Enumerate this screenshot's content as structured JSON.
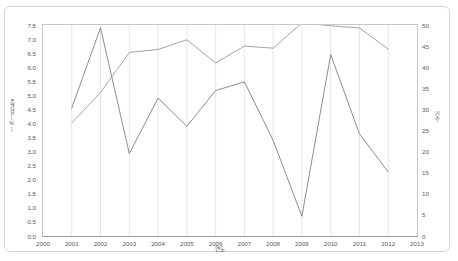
{
  "chart": {
    "type": "line",
    "title": "",
    "background_color": "#ffffff",
    "frame_color": "#d3d3d3",
    "grid": {
      "vertical": true,
      "horizontal": false,
      "color": "#e6e6e6"
    },
    "legend": {
      "visible": false,
      "position": "none"
    }
  },
  "axes": {
    "x": {
      "label": "연도",
      "ticks": [
        "2000",
        "2001",
        "2002",
        "2003",
        "2004",
        "2005",
        "2006",
        "2007",
        "2008",
        "2009",
        "2010",
        "2011",
        "2012",
        "2013"
      ],
      "min": 2000,
      "max": 2013
    },
    "y_left": {
      "label": "증가율(%)",
      "ticks": [
        "0.0",
        "0.5",
        "1.0",
        "1.5",
        "2.0",
        "2.5",
        "3.0",
        "3.5",
        "4.0",
        "4.5",
        "5.0",
        "5.5",
        "6.0",
        "6.5",
        "7.0",
        "7.5"
      ],
      "min": 0.0,
      "max": 7.5,
      "step": 0.5
    },
    "y_right": {
      "label": "건수",
      "ticks": [
        "0",
        "5",
        "10",
        "15",
        "20",
        "25",
        "30",
        "35",
        "40",
        "45",
        "50"
      ],
      "min": 0,
      "max": 50,
      "step": 5
    }
  },
  "chart_data": {
    "type": "line",
    "title": "",
    "xlabel": "연도",
    "ylabel": "증가율(%)",
    "ylabel_right": "건수",
    "x": [
      2001,
      2002,
      2003,
      2004,
      2005,
      2006,
      2007,
      2008,
      2009,
      2010,
      2011,
      2012
    ],
    "xlim": [
      2000,
      2013
    ],
    "ylim": [
      0.0,
      7.5
    ],
    "ylim_right": [
      0,
      50
    ],
    "grid": "vertical-only",
    "legend_position": "none",
    "series": [
      {
        "name": "series-1",
        "axis": "left",
        "color": "#808080",
        "values": [
          4.55,
          7.4,
          2.93,
          4.9,
          3.9,
          5.17,
          5.48,
          3.4,
          0.7,
          6.45,
          3.63,
          2.28
        ]
      },
      {
        "name": "series-2",
        "axis": "right",
        "color": "#9a9a9a",
        "values": [
          26.8,
          34.0,
          43.5,
          44.2,
          46.5,
          41.0,
          45.0,
          44.5,
          50.5,
          49.8,
          49.3,
          44.3
        ]
      }
    ]
  }
}
